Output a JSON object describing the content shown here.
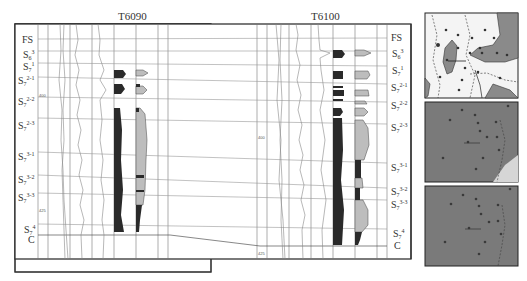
{
  "figure": {
    "wells": [
      {
        "name": "T6090",
        "depth_ticks": [
          "400",
          "425"
        ],
        "layers": [
          {
            "base": "FS",
            "sub": "",
            "sup": ""
          },
          {
            "base": "S",
            "sub": "6",
            "sup": "3"
          },
          {
            "base": "S",
            "sub": "7",
            "sup": "1"
          },
          {
            "base": "S",
            "sub": "7",
            "sup": "2-1"
          },
          {
            "base": "S",
            "sub": "7",
            "sup": "2-2"
          },
          {
            "base": "S",
            "sub": "7",
            "sup": "2-3"
          },
          {
            "base": "S",
            "sub": "7",
            "sup": "3-1"
          },
          {
            "base": "S",
            "sub": "7",
            "sup": "3-2"
          },
          {
            "base": "S",
            "sub": "7",
            "sup": "3-3"
          },
          {
            "base": "S",
            "sub": "7",
            "sup": "4"
          },
          {
            "base": "C",
            "sub": "",
            "sup": ""
          }
        ]
      },
      {
        "name": "T6100",
        "depth_ticks": [
          "400",
          "425"
        ],
        "layers": [
          {
            "base": "FS",
            "sub": "",
            "sup": ""
          },
          {
            "base": "S",
            "sub": "6",
            "sup": "3"
          },
          {
            "base": "S",
            "sub": "7",
            "sup": "1"
          },
          {
            "base": "S",
            "sub": "7",
            "sup": "2-1"
          },
          {
            "base": "S",
            "sub": "7",
            "sup": "2-2"
          },
          {
            "base": "S",
            "sub": "7",
            "sup": "2-3"
          },
          {
            "base": "S",
            "sub": "7",
            "sup": "3-1"
          },
          {
            "base": "S",
            "sub": "7",
            "sup": "3-2"
          },
          {
            "base": "S",
            "sub": "7",
            "sup": "3-3"
          },
          {
            "base": "S",
            "sub": "7",
            "sup": "4"
          },
          {
            "base": "C",
            "sub": "",
            "sup": ""
          }
        ]
      }
    ],
    "map_panels": [
      {
        "id": "map-top",
        "well_labels": [
          "T6090",
          "T6100",
          "T6118",
          "T6124",
          "T6130",
          "T6082"
        ]
      },
      {
        "id": "map-middle",
        "well_labels": []
      },
      {
        "id": "map-bottom",
        "well_labels": []
      }
    ],
    "colors": {
      "sand_dark": "#2a2a2a",
      "sand_light": "#bdbdbd",
      "map_fill": "#7a7a7a",
      "map_shade": "#9a9a9a",
      "line": "#555555"
    }
  }
}
